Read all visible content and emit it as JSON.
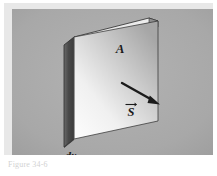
{
  "figure": {
    "background_color": "#a9a9a9",
    "frame_color": "#e8e8e8",
    "page_color": "#ffffff",
    "caption": "Figure 34-6",
    "labels": {
      "area": "A",
      "thickness": "dx",
      "vector": "S"
    },
    "geometry": {
      "front_face_color_light": "#f2f2f2",
      "front_face_color_dark": "#9a9a9a",
      "side_face_color": "#4e4e4e",
      "top_face_color": "#dcdcdc",
      "outline_color": "#2b2b2b",
      "arrow_color": "#1b1b1b"
    }
  }
}
